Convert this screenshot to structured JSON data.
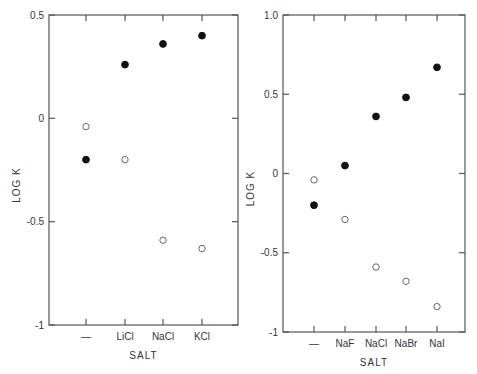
{
  "chart_data": [
    {
      "type": "scatter",
      "title": "",
      "xlabel": "SALT",
      "ylabel": "LOG K",
      "ylim": [
        -1,
        0.5
      ],
      "yticks": [
        0.5,
        0,
        -0.5,
        -1
      ],
      "ytick_labels": [
        "0.5",
        "0",
        "-0.5",
        "-1"
      ],
      "categories": [
        "—",
        "LiCl",
        "NaCl",
        "KCl"
      ],
      "grid": false,
      "legend": null,
      "series": [
        {
          "name": "filled",
          "marker": "filled-circle",
          "values": [
            -0.2,
            0.26,
            0.36,
            0.4
          ]
        },
        {
          "name": "open",
          "marker": "open-circle",
          "values": [
            -0.04,
            -0.2,
            -0.59,
            -0.63
          ]
        }
      ]
    },
    {
      "type": "scatter",
      "title": "",
      "xlabel": "SALT",
      "ylabel": "LOG K",
      "ylim": [
        -1,
        1.0
      ],
      "yticks": [
        1.0,
        0.5,
        0,
        -0.5,
        -1
      ],
      "ytick_labels": [
        "1.0",
        "0.5",
        "0",
        "-0.5",
        "-1"
      ],
      "categories": [
        "—",
        "NaF",
        "NaCl",
        "NaBr",
        "NaI"
      ],
      "grid": false,
      "legend": null,
      "series": [
        {
          "name": "filled",
          "marker": "filled-circle",
          "values": [
            -0.2,
            0.05,
            0.36,
            0.48,
            0.67
          ]
        },
        {
          "name": "open",
          "marker": "open-circle",
          "values": [
            -0.04,
            -0.29,
            -0.59,
            -0.68,
            -0.84
          ]
        }
      ]
    }
  ],
  "layout": {
    "panels": [
      {
        "x0": 49,
        "x1": 238,
        "y0": 15,
        "y1": 325,
        "cat_x": [
          86,
          125,
          163,
          202
        ]
      },
      {
        "x0": 283,
        "x1": 465,
        "y0": 15,
        "y1": 332,
        "cat_x": [
          314,
          345,
          376,
          406,
          437
        ]
      }
    ]
  }
}
